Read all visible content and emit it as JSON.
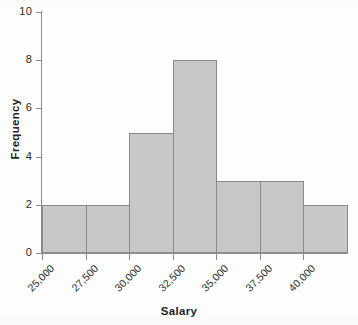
{
  "chart_data": {
    "type": "bar",
    "title": "",
    "xlabel": "Salary",
    "ylabel": "Frequency",
    "categories": [
      "25,000-27,500",
      "27,500-30,000",
      "30,000-32,500",
      "32,500-35,000",
      "35,000-37,500",
      "37,500-40,000",
      "40,000-42,500"
    ],
    "bin_edges": [
      25000,
      27500,
      30000,
      32500,
      35000,
      37500,
      40000,
      42500
    ],
    "values": [
      2,
      2,
      5,
      8,
      3,
      3,
      2
    ],
    "x_tick_labels": [
      "25,000",
      "27,500",
      "30,000",
      "32,500",
      "35,000",
      "37,500",
      "40,000"
    ],
    "y_tick_labels": [
      "0",
      "2",
      "4",
      "6",
      "8",
      "10"
    ],
    "y_tick_values": [
      0,
      2,
      4,
      6,
      8,
      10
    ],
    "ylim": [
      0,
      10
    ],
    "grid": false,
    "legend": false,
    "bar_fill_color": "#c8c8c8",
    "bar_edge_color": "#8a8a8a",
    "axis_color": "#8c8c8c",
    "text_color": "#2b2b2b",
    "background_color": "#fdfdfc"
  }
}
